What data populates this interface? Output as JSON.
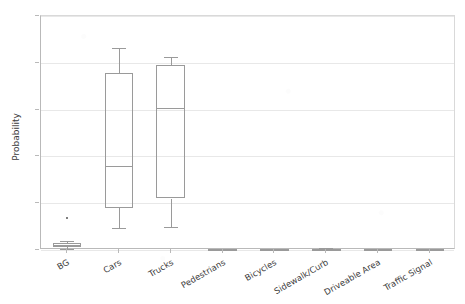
{
  "chart_data": {
    "type": "box",
    "title": "",
    "xlabel": "",
    "ylabel": "Probability",
    "ylim": [
      0.0,
      1.0
    ],
    "yticks": [
      0.0,
      0.2,
      0.4,
      0.6,
      0.8,
      1.0
    ],
    "ytick_labels": [
      "0.0",
      "0.2",
      "0.4",
      "0.6",
      "0.8",
      "1.0"
    ],
    "grid": "horizontal",
    "legend": "none",
    "categories": [
      "BG",
      "Cars",
      "Trucks",
      "Pedestrians",
      "Bicycles",
      "Sidewalk/Curb",
      "Driveable Area",
      "Traffic Signal"
    ],
    "boxes": [
      {
        "category": "BG",
        "whisker_low": 0.005,
        "q1": 0.012,
        "median": 0.021,
        "q3": 0.031,
        "whisker_high": 0.04,
        "fliers": [
          0.135
        ]
      },
      {
        "category": "Cars",
        "whisker_low": 0.095,
        "q1": 0.18,
        "median": 0.36,
        "q3": 0.755,
        "whisker_high": 0.865,
        "fliers": []
      },
      {
        "category": "Trucks",
        "whisker_low": 0.1,
        "q1": 0.22,
        "median": 0.605,
        "q3": 0.79,
        "whisker_high": 0.825,
        "fliers": []
      },
      {
        "category": "Pedestrians",
        "whisker_low": 0.0,
        "q1": 0.001,
        "median": 0.002,
        "q3": 0.004,
        "whisker_high": 0.006,
        "fliers": []
      },
      {
        "category": "Bicycles",
        "whisker_low": 0.0,
        "q1": 0.001,
        "median": 0.002,
        "q3": 0.003,
        "whisker_high": 0.005,
        "fliers": []
      },
      {
        "category": "Sidewalk/Curb",
        "whisker_low": 0.0,
        "q1": 0.001,
        "median": 0.003,
        "q3": 0.005,
        "whisker_high": 0.008,
        "fliers": []
      },
      {
        "category": "Driveable Area",
        "whisker_low": 0.0,
        "q1": 0.001,
        "median": 0.002,
        "q3": 0.004,
        "whisker_high": 0.006,
        "fliers": []
      },
      {
        "category": "Traffic Signal",
        "whisker_low": 0.0,
        "q1": 0.001,
        "median": 0.002,
        "q3": 0.004,
        "whisker_high": 0.006,
        "fliers": []
      }
    ],
    "colors": {
      "background": "#ffffff",
      "gridline": "#e8e8e8",
      "axis": "#b9b9b9",
      "box_line": "#9a9a9a",
      "flier": "#555555",
      "text": "#3a3a3a"
    }
  }
}
